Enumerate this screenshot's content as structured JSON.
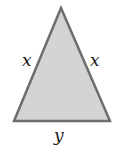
{
  "diagram": {
    "shape": "isosceles-triangle",
    "fill_color": "#d4d4d4",
    "stroke_color": "#6e6e6e",
    "labels": {
      "left_side": "x",
      "right_side": "x",
      "base": "y"
    }
  }
}
